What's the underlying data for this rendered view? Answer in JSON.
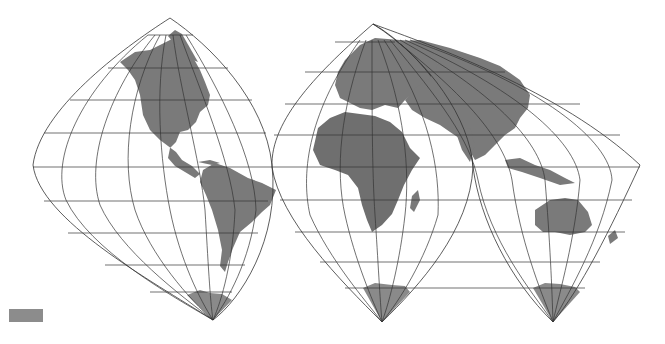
{
  "map": {
    "title": "",
    "projection": "Interrupted sinusoidal-type world map (three lobes)",
    "lobes": [
      {
        "name": "Americas lobe",
        "apex_top": [
          170,
          18
        ],
        "apex_bottom": [
          213,
          320
        ]
      },
      {
        "name": "Europe-Africa lobe",
        "apex_top": [
          373,
          24
        ],
        "apex_bottom": [
          382,
          322
        ]
      },
      {
        "name": "Asia-Australia lobe",
        "apex_top": [
          373,
          24
        ],
        "apex_bottom": [
          553,
          322
        ]
      }
    ],
    "colors": {
      "land": "#7a7a7a",
      "land_dark": "#6e6e6e",
      "graticule": "#333333",
      "background": "#ffffff",
      "antarctica": "#8a8a8a"
    }
  },
  "legend": {
    "swatch_color": "#8c8c8c",
    "label": ""
  }
}
